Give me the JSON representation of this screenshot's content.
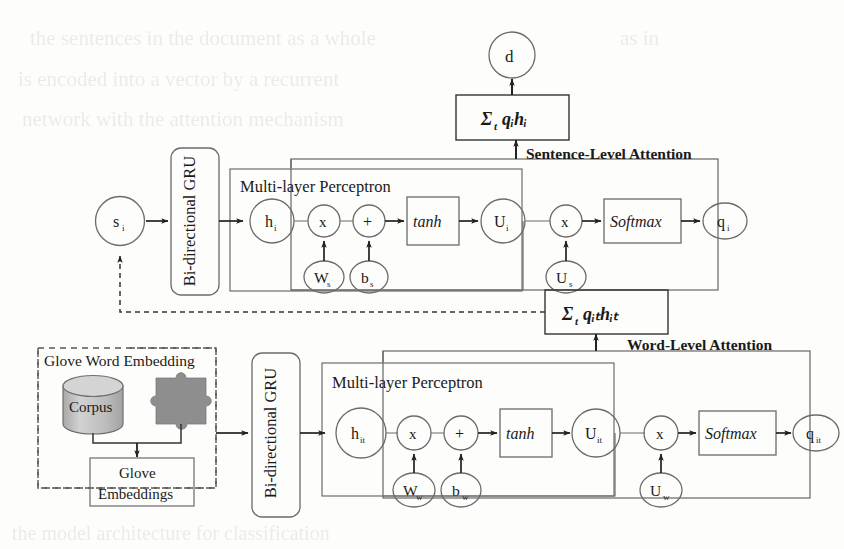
{
  "diagram": {
    "colors": {
      "stroke": "#555555",
      "text": "#1a1a1a",
      "cylinder_fill": "#b9b9b9",
      "cylinder_top": "#cfcfcf",
      "puzzle_fill": "#8f8f8f",
      "background": "#fdfdfb",
      "dashed": "#444444"
    },
    "sentence_level": {
      "attention_label": "Sentence-Level Attention",
      "input_node": "s",
      "input_node_sub": "i",
      "gru_label": "Bi-directional GRU",
      "mlp_label": "Multi-layer Perceptron",
      "hidden_node": "h",
      "hidden_node_sub": "i",
      "mul_node": "x",
      "add_node": "+",
      "weight_node": "W",
      "weight_node_sub": "s",
      "bias_node": "b",
      "bias_node_sub": "s",
      "activation": "tanh",
      "u_node": "U",
      "u_node_sub": "i",
      "mul_node_2": "x",
      "context_node": "U",
      "context_node_sub": "s",
      "softmax": "Softmax",
      "q_node": "q",
      "q_node_sub": "i",
      "sum_formula": "Σ",
      "sum_sub": "t",
      "sum_terms": "qᵢhᵢ",
      "output_node": "d"
    },
    "word_level": {
      "attention_label": "Word-Level Attention",
      "gru_label": "Bi-directional GRU",
      "mlp_label": "Multi-layer Perceptron",
      "hidden_node": "h",
      "hidden_node_sub": "it",
      "mul_node": "x",
      "add_node": "+",
      "weight_node": "W",
      "weight_node_sub": "w",
      "bias_node": "b",
      "bias_node_sub": "w",
      "activation": "tanh",
      "u_node": "U",
      "u_node_sub": "it",
      "mul_node_2": "x",
      "context_node": "U",
      "context_node_sub": "w",
      "softmax": "Softmax",
      "q_node": "q",
      "q_node_sub": "it",
      "sum_formula": "Σ",
      "sum_sub": "t",
      "sum_terms": "qᵢₜhᵢₜ"
    },
    "embedding": {
      "panel_label": "Glove Word Embedding",
      "corpus_label": "Corpus",
      "output_line1": "Glove",
      "output_line2": "Embeddings",
      "puzzle_icon": "puzzle-piece-icon",
      "database_icon": "database-cylinder-icon"
    }
  }
}
